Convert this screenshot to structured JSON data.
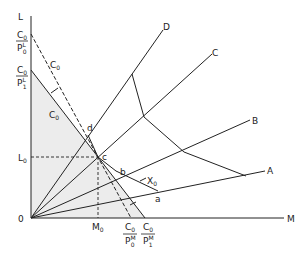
{
  "diagram": {
    "axes": {
      "y_label": "L",
      "x_label": "M",
      "origin_label": "0"
    },
    "y_intercepts": {
      "upper": {
        "num": "C",
        "num_sub": "0",
        "den": "P",
        "den_sup": "L",
        "den_sub": "0"
      },
      "lower": {
        "num": "C",
        "num_sub": "0",
        "den": "P",
        "den_sup": "L",
        "den_sub": "1"
      }
    },
    "x_intercepts": {
      "left": {
        "num": "C",
        "num_sub": "0",
        "den": "P",
        "den_sup": "M",
        "den_sub": "0"
      },
      "right": {
        "num": "C",
        "num_sub": "0",
        "den": "P",
        "den_sup": "M",
        "den_sub": "1"
      }
    },
    "ref_labels": {
      "L0": "L",
      "L0_sub": "0",
      "M0": "M",
      "M0_sub": "0"
    },
    "budget_labels": {
      "dashed": "C",
      "dashed_sub": "0",
      "solid": "C",
      "solid_sub": "0"
    },
    "rays": [
      {
        "label": "A"
      },
      {
        "label": "B"
      },
      {
        "label": "C"
      },
      {
        "label": "D"
      }
    ],
    "points": {
      "a": "a",
      "b": "b",
      "c": "c",
      "d": "d"
    },
    "isoquant_label": "X",
    "isoquant_label_sub": "0",
    "colors": {
      "line": "#222222",
      "shade": "#ececec",
      "background": "#ffffff"
    }
  }
}
